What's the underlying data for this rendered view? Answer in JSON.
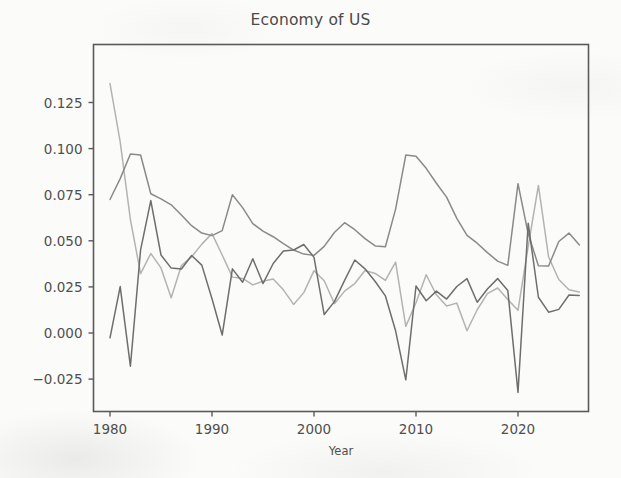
{
  "figure": {
    "title": "Economy of US",
    "background_color": "#fbfbfa",
    "frame_color": "#5a5a5a"
  },
  "axes": {
    "xlabel": "Year",
    "ylabel": "",
    "xticks": [
      "1980",
      "1990",
      "2000",
      "2010",
      "2020"
    ],
    "yticks": [
      "0.125",
      "0.100",
      "0.075",
      "0.050",
      "0.025",
      "0.000",
      "−0.025"
    ]
  },
  "chart_data": {
    "type": "line",
    "title": "Economy of US",
    "xlabel": "Year",
    "ylabel": "",
    "xlim": [
      1978.7,
      1978.7
    ],
    "ylim": [
      -0.0405,
      0.1445
    ],
    "xticks": [
      1980,
      1990,
      2000,
      2010,
      2020
    ],
    "yticks": [
      0.125,
      0.1,
      0.075,
      0.05,
      0.025,
      0.0,
      -0.025
    ],
    "grid": false,
    "legend": "none",
    "x": [
      1980,
      1981,
      1982,
      1983,
      1984,
      1985,
      1986,
      1987,
      1988,
      1989,
      1990,
      1991,
      1992,
      1993,
      1994,
      1995,
      1996,
      1997,
      1998,
      1999,
      2000,
      2001,
      2002,
      2003,
      2004,
      2005,
      2006,
      2007,
      2008,
      2009,
      2010,
      2011,
      2012,
      2013,
      2014,
      2015,
      2016,
      2017,
      2018,
      2019,
      2020,
      2021,
      2022,
      2023,
      2024,
      2025,
      2026
    ],
    "series": [
      {
        "name": "series-light-gray",
        "color": "#b3b3b3",
        "values": [
          0.1353,
          0.1036,
          0.0615,
          0.0322,
          0.0431,
          0.0353,
          0.0191,
          0.0366,
          0.0413,
          0.0482,
          0.0539,
          0.0423,
          0.0303,
          0.0296,
          0.0261,
          0.0281,
          0.0293,
          0.0234,
          0.0155,
          0.0219,
          0.0338,
          0.0283,
          0.0159,
          0.0227,
          0.0268,
          0.0339,
          0.0323,
          0.0285,
          0.0384,
          0.0036,
          0.0164,
          0.0316,
          0.0207,
          0.0146,
          0.0162,
          0.0012,
          0.0126,
          0.0213,
          0.0244,
          0.0181,
          0.0123,
          0.047,
          0.08,
          0.0412,
          0.029,
          0.0235,
          0.0222
        ]
      },
      {
        "name": "series-medium-gray",
        "color": "#8a8a8a",
        "values": [
          0.0724,
          0.0837,
          0.0971,
          0.0965,
          0.0755,
          0.0727,
          0.0695,
          0.064,
          0.0582,
          0.0542,
          0.0528,
          0.0555,
          0.075,
          0.068,
          0.0593,
          0.0552,
          0.0522,
          0.0485,
          0.045,
          0.0428,
          0.0421,
          0.047,
          0.0545,
          0.0598,
          0.056,
          0.0512,
          0.0472,
          0.0468,
          0.0672,
          0.0965,
          0.0958,
          0.0893,
          0.0812,
          0.0737,
          0.0622,
          0.0529,
          0.0487,
          0.0436,
          0.039,
          0.0367,
          0.081,
          0.0538,
          0.0365,
          0.0363,
          0.0496,
          0.0542,
          0.0478
        ]
      },
      {
        "name": "series-dark-gray",
        "color": "#6e6e6e",
        "values": [
          -0.0026,
          0.0252,
          -0.018,
          0.0451,
          0.0718,
          0.0423,
          0.0352,
          0.0347,
          0.042,
          0.0368,
          0.0186,
          -0.0011,
          0.0348,
          0.0275,
          0.0403,
          0.0268,
          0.0377,
          0.0445,
          0.045,
          0.048,
          0.041,
          0.01,
          0.017,
          0.0285,
          0.0396,
          0.0348,
          0.0279,
          0.0201,
          0.0012,
          -0.0254,
          0.0255,
          0.0175,
          0.0227,
          0.0184,
          0.0252,
          0.0295,
          0.0167,
          0.0239,
          0.0295,
          0.0231,
          -0.0322,
          0.0595,
          0.0194,
          0.0113,
          0.0128,
          0.0206,
          0.0203
        ]
      }
    ]
  }
}
